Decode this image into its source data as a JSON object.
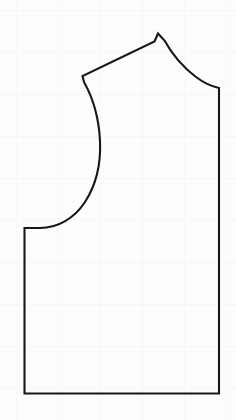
{
  "document": {
    "title": "Sewing Pattern Piece",
    "subject": "bodice-block-outline",
    "width": 236,
    "height": 420
  },
  "canvas": {
    "background_color": "#fdfdfd",
    "paper_type": "graph-paper"
  },
  "grid": {
    "visible": true,
    "minor_color": "#fbfbfb",
    "major_color": "#f4f4f6",
    "minor_spacing": 7,
    "major_spacing": 42,
    "minor_origin_x": 0,
    "minor_origin_y": 3,
    "major_origin_x": 16,
    "major_origin_y": 10
  },
  "outline": {
    "name": "pattern-outline",
    "stroke_color": "#17171a",
    "stroke_width": 2.1,
    "fill": "none",
    "line_join": "miter",
    "line_cap": "butt",
    "path": "M 24.5 228 L 24.5 393.5 L 219 393.5 L 219 88 C 212 86.5 204 83 196 77 C 184 68 172 54 164.5 40.5 L 158 33.5 L 154.5 41.5 L 82.5 76 L 84 82 C 93 98 99 120 100 141 C 101 163 96 185 85 202 C 74 219 57 228 40 228 Z"
  },
  "vertices": {
    "shoulder_tip": {
      "x": 158,
      "y": 34,
      "label": "shoulder-tip"
    },
    "shoulder_inner": {
      "x": 82,
      "y": 76,
      "label": "shoulder-inner-corner"
    },
    "side_top": {
      "x": 24,
      "y": 228,
      "label": "side-seam-top-corner"
    },
    "hem_left": {
      "x": 25,
      "y": 394,
      "label": "hem-left-corner"
    },
    "hem_right": {
      "x": 219,
      "y": 394,
      "label": "hem-right-corner"
    },
    "underarm": {
      "x": 219,
      "y": 88,
      "label": "underarm-corner"
    }
  },
  "segments": [
    {
      "name": "shoulder-seam",
      "type": "line",
      "from": "shoulder_inner",
      "to": "shoulder_tip"
    },
    {
      "name": "armhole-curve",
      "type": "curve",
      "from": "shoulder_tip",
      "to": "underarm"
    },
    {
      "name": "side-seam-right",
      "type": "line",
      "from": "underarm",
      "to": "hem_right"
    },
    {
      "name": "hem-line",
      "type": "line",
      "from": "hem_right",
      "to": "hem_left"
    },
    {
      "name": "center-front-line",
      "type": "line",
      "from": "hem_left",
      "to": "side_top"
    },
    {
      "name": "neckline-curve",
      "type": "curve",
      "from": "side_top",
      "to": "shoulder_inner"
    }
  ]
}
